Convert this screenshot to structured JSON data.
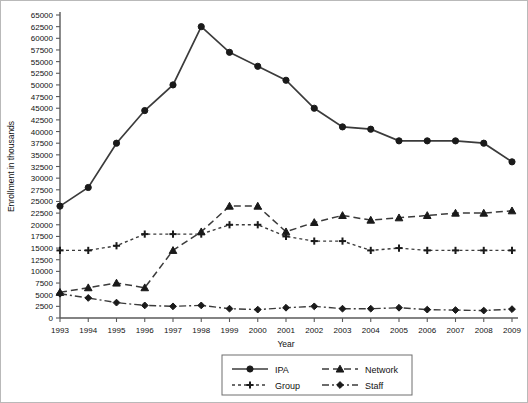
{
  "chart_data": {
    "type": "line",
    "title": "",
    "xlabel": "Year",
    "ylabel": "Enrollment in thousands",
    "categories": [
      1993,
      1994,
      1995,
      1996,
      1997,
      1998,
      1999,
      2000,
      2001,
      2002,
      2003,
      2004,
      2005,
      2006,
      2007,
      2008,
      2009
    ],
    "xlim": [
      1993,
      2009
    ],
    "ylim": [
      0,
      65000
    ],
    "ytick_step": 2500,
    "yticks": [
      0,
      2500,
      5000,
      7500,
      10000,
      12500,
      15000,
      17500,
      20000,
      22500,
      25000,
      27500,
      30000,
      32500,
      35000,
      37500,
      40000,
      42500,
      45000,
      47500,
      50000,
      52500,
      55000,
      57500,
      60000,
      62500,
      65000
    ],
    "grid": false,
    "legend_position": "bottom-center",
    "series": [
      {
        "name": "IPA",
        "marker": "circle",
        "line_style": "solid",
        "color": "#3b3b3b",
        "values": [
          24000,
          28000,
          37500,
          44500,
          50000,
          62500,
          57000,
          54000,
          51000,
          45000,
          41000,
          40500,
          38000,
          38000,
          38000,
          37500,
          33500
        ]
      },
      {
        "name": "Network",
        "marker": "triangle",
        "line_style": "dashed",
        "color": "#3b3b3b",
        "values": [
          5500,
          6500,
          7500,
          6500,
          14500,
          18500,
          24000,
          24000,
          18500,
          20500,
          22000,
          21000,
          21500,
          22000,
          22500,
          22500,
          23000
        ]
      },
      {
        "name": "Group",
        "marker": "plus",
        "line_style": "dotted-dashed",
        "color": "#3b3b3b",
        "values": [
          14500,
          14500,
          15500,
          18000,
          18000,
          18000,
          20000,
          20000,
          17500,
          16500,
          16500,
          14500,
          15000,
          14500,
          14500,
          14500,
          14500
        ]
      },
      {
        "name": "Staff",
        "marker": "diamond",
        "line_style": "dash-dot",
        "color": "#3b3b3b",
        "values": [
          5200,
          4300,
          3300,
          2700,
          2500,
          2700,
          2000,
          1800,
          2200,
          2500,
          2000,
          2000,
          2200,
          1800,
          1700,
          1600,
          1900
        ]
      }
    ]
  },
  "legend": {
    "items": [
      {
        "label": "IPA"
      },
      {
        "label": "Network"
      },
      {
        "label": "Group"
      },
      {
        "label": "Staff"
      }
    ]
  }
}
